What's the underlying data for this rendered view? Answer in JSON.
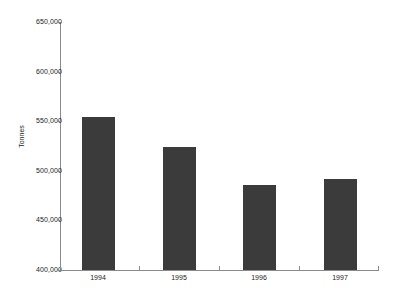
{
  "chart_data": {
    "type": "bar",
    "title": "",
    "subtitle": "",
    "xlabel": "",
    "ylabel": "Tonnes",
    "categories": [
      "1994",
      "1995",
      "1996",
      "1997"
    ],
    "values": [
      554000,
      524000,
      486000,
      492000
    ],
    "series": [
      {
        "name": "Tonnes",
        "values": [
          554000,
          524000,
          486000,
          492000
        ]
      }
    ],
    "ylim": [
      400000,
      650000
    ],
    "ytick_values": [
      650000,
      600000,
      550000,
      500000,
      450000,
      400000
    ],
    "ytick_labels": [
      "650,000",
      "600,000",
      "550,000",
      "500,000",
      "450,000",
      "400,000"
    ],
    "grid": false,
    "legend": false,
    "legend_position": "none",
    "annotations": [],
    "bar_color": "#3b3b3b",
    "axis_color": "#8a8a8a",
    "background_color": "#ffffff"
  }
}
